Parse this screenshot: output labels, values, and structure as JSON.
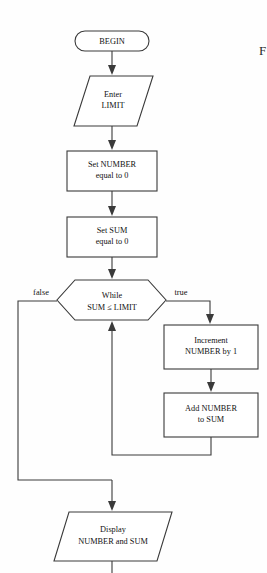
{
  "diagram": {
    "title_fragment": "F",
    "nodes": [
      {
        "id": "begin",
        "type": "terminal",
        "lines": [
          "BEGIN"
        ]
      },
      {
        "id": "enter-limit",
        "type": "input-output",
        "lines": [
          "Enter",
          "LIMIT"
        ]
      },
      {
        "id": "set-number",
        "type": "process",
        "lines": [
          "Set NUMBER",
          "equal to 0"
        ]
      },
      {
        "id": "set-sum",
        "type": "process",
        "lines": [
          "Set SUM",
          "equal to 0"
        ]
      },
      {
        "id": "while-condition",
        "type": "decision",
        "lines": [
          "While",
          "SUM ≤ LIMIT"
        ]
      },
      {
        "id": "increment-number",
        "type": "process",
        "lines": [
          "Increment",
          "NUMBER by 1"
        ]
      },
      {
        "id": "add-number",
        "type": "process",
        "lines": [
          "Add NUMBER",
          "to SUM"
        ]
      },
      {
        "id": "display-results",
        "type": "input-output",
        "lines": [
          "Display",
          "NUMBER and SUM"
        ]
      }
    ],
    "branches": {
      "false_label": "false",
      "true_label": "true"
    },
    "colors": {
      "stroke": "#3a3a3a",
      "fill": "#ffffff",
      "text": "#111111",
      "background": "#fefefe"
    }
  }
}
